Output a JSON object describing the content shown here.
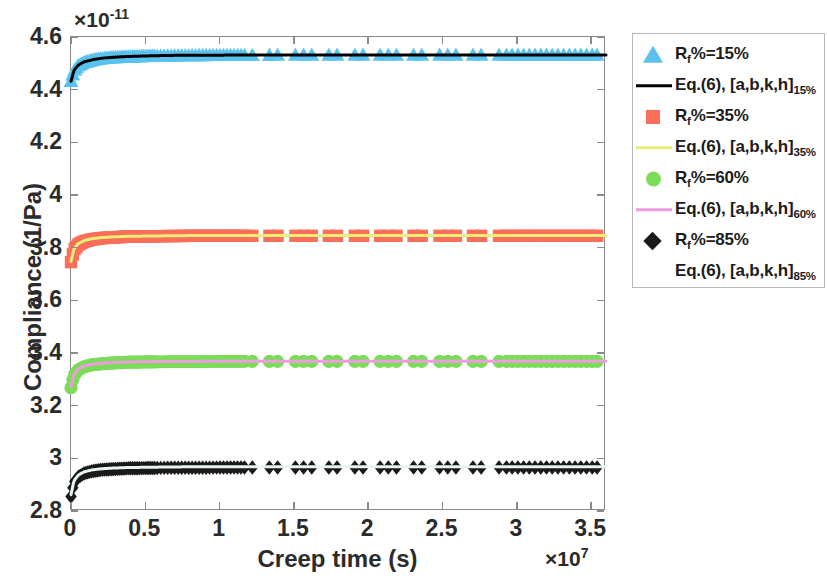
{
  "chart_data": {
    "type": "scatter",
    "title": "",
    "xlabel": "Creep time  (s)",
    "ylabel": "Compliance (1/Pa)",
    "x_exponent_label": "×10",
    "x_exponent_value": "7",
    "y_exponent_label": "×10",
    "y_exponent_value": "-11",
    "xlim": [
      0,
      3.6
    ],
    "ylim": [
      2.8,
      4.6
    ],
    "xticks": [
      "0",
      "0.5",
      "1",
      "1.5",
      "2",
      "2.5",
      "3",
      "3.5"
    ],
    "xtick_values": [
      0,
      0.5,
      1,
      1.5,
      2,
      2.5,
      3,
      3.5
    ],
    "yticks": [
      "2.8",
      "3",
      "3.2",
      "3.4",
      "3.6",
      "3.8",
      "4",
      "4.2",
      "4.4",
      "4.6"
    ],
    "ytick_values": [
      2.8,
      3.0,
      3.2,
      3.4,
      3.6,
      3.8,
      4.0,
      4.2,
      4.4,
      4.6
    ],
    "grid": false,
    "legend_position": "right-outside",
    "series": [
      {
        "name": "R_f%=15%",
        "marker": "triangle",
        "color": "#5BC2F0",
        "plateau": 4.532,
        "start": 4.432,
        "x": [
          0.0,
          0.02,
          0.05,
          0.09,
          0.14,
          0.2,
          0.28,
          0.38,
          0.5,
          0.65,
          0.82,
          1.0,
          1.2,
          1.45,
          1.7,
          2.0,
          2.3,
          2.6,
          2.9,
          3.2,
          3.5
        ],
        "values": [
          4.432,
          4.472,
          4.492,
          4.504,
          4.512,
          4.518,
          4.522,
          4.525,
          4.527,
          4.529,
          4.53,
          4.531,
          4.531,
          4.532,
          4.532,
          4.532,
          4.532,
          4.532,
          4.532,
          4.532,
          4.532
        ]
      },
      {
        "name": "Eq.(6), [a,b,k,h]_15%",
        "marker": "line",
        "color": "#000000",
        "x": [
          0.0,
          0.02,
          0.05,
          0.09,
          0.14,
          0.2,
          0.28,
          0.38,
          0.5,
          0.65,
          0.82,
          1.0,
          1.2,
          1.45,
          1.7,
          2.0,
          2.3,
          2.6,
          2.9,
          3.2,
          3.5
        ],
        "values": [
          4.432,
          4.474,
          4.494,
          4.506,
          4.513,
          4.519,
          4.523,
          4.526,
          4.528,
          4.53,
          4.531,
          4.531,
          4.532,
          4.532,
          4.532,
          4.532,
          4.532,
          4.532,
          4.532,
          4.532,
          4.532
        ]
      },
      {
        "name": "R_f%=35%",
        "marker": "square",
        "color": "#FA6E5A",
        "plateau": 3.845,
        "start": 3.745,
        "x": [
          0.0,
          0.02,
          0.05,
          0.09,
          0.14,
          0.2,
          0.28,
          0.38,
          0.5,
          0.65,
          0.82,
          1.0,
          1.2,
          1.45,
          1.7,
          2.0,
          2.3,
          2.6,
          2.9,
          3.2,
          3.5
        ],
        "values": [
          3.745,
          3.792,
          3.812,
          3.824,
          3.831,
          3.836,
          3.839,
          3.842,
          3.843,
          3.844,
          3.845,
          3.845,
          3.845,
          3.845,
          3.845,
          3.845,
          3.845,
          3.845,
          3.845,
          3.845,
          3.845
        ]
      },
      {
        "name": "Eq.(6), [a,b,k,h]_35%",
        "marker": "line",
        "color": "#E8F07A",
        "x": [
          0.0,
          0.02,
          0.05,
          0.09,
          0.14,
          0.2,
          0.28,
          0.38,
          0.5,
          0.65,
          0.82,
          1.0,
          1.2,
          1.45,
          1.7,
          2.0,
          2.3,
          2.6,
          2.9,
          3.2,
          3.5
        ],
        "values": [
          3.748,
          3.796,
          3.816,
          3.827,
          3.834,
          3.838,
          3.841,
          3.843,
          3.844,
          3.845,
          3.846,
          3.846,
          3.846,
          3.846,
          3.846,
          3.846,
          3.846,
          3.846,
          3.846,
          3.846,
          3.846
        ]
      },
      {
        "name": "R_f%=60%",
        "marker": "circle",
        "color": "#7CDC5A",
        "plateau": 3.368,
        "start": 3.268,
        "x": [
          0.0,
          0.02,
          0.05,
          0.09,
          0.14,
          0.2,
          0.28,
          0.38,
          0.5,
          0.65,
          0.82,
          1.0,
          1.2,
          1.45,
          1.7,
          2.0,
          2.3,
          2.6,
          2.9,
          3.2,
          3.5
        ],
        "values": [
          3.268,
          3.316,
          3.336,
          3.348,
          3.355,
          3.359,
          3.362,
          3.365,
          3.366,
          3.367,
          3.367,
          3.368,
          3.368,
          3.368,
          3.368,
          3.368,
          3.368,
          3.368,
          3.368,
          3.368,
          3.368
        ]
      },
      {
        "name": "Eq.(6), [a,b,k,h]_60%",
        "marker": "line",
        "color": "#EE9CE0",
        "x": [
          0.0,
          0.02,
          0.05,
          0.09,
          0.14,
          0.2,
          0.28,
          0.38,
          0.5,
          0.65,
          0.82,
          1.0,
          1.2,
          1.45,
          1.7,
          2.0,
          2.3,
          2.6,
          2.9,
          3.2,
          3.5
        ],
        "values": [
          3.272,
          3.32,
          3.34,
          3.351,
          3.357,
          3.361,
          3.364,
          3.366,
          3.367,
          3.368,
          3.368,
          3.369,
          3.369,
          3.369,
          3.369,
          3.369,
          3.369,
          3.369,
          3.369,
          3.369,
          3.369
        ]
      },
      {
        "name": "R_f%=85%",
        "marker": "diamond",
        "color": "#1A1A1A",
        "plateau": 2.965,
        "start": 2.855,
        "x": [
          0.0,
          0.02,
          0.05,
          0.09,
          0.14,
          0.2,
          0.28,
          0.38,
          0.5,
          0.65,
          0.82,
          1.0,
          1.2,
          1.45,
          1.7,
          2.0,
          2.3,
          2.6,
          2.9,
          3.2,
          3.5
        ],
        "values": [
          2.855,
          2.908,
          2.93,
          2.943,
          2.951,
          2.956,
          2.959,
          2.962,
          2.963,
          2.964,
          2.964,
          2.965,
          2.965,
          2.965,
          2.965,
          2.965,
          2.965,
          2.965,
          2.965,
          2.965,
          2.965
        ]
      },
      {
        "name": "Eq.(6), [a,b,k,h]_85%",
        "marker": "line",
        "color": "#E8F4F4",
        "x": [
          0.0,
          0.02,
          0.05,
          0.09,
          0.14,
          0.2,
          0.28,
          0.38,
          0.5,
          0.65,
          0.82,
          1.0,
          1.2,
          1.45,
          1.7,
          2.0,
          2.3,
          2.6,
          2.9,
          3.2,
          3.5
        ],
        "values": [
          2.862,
          2.915,
          2.937,
          2.949,
          2.956,
          2.96,
          2.963,
          2.965,
          2.966,
          2.967,
          2.968,
          2.968,
          2.968,
          2.968,
          2.968,
          2.968,
          2.968,
          2.968,
          2.968,
          2.968,
          2.968
        ]
      }
    ]
  },
  "axes": {
    "x_title": "Creep time  (s)",
    "y_title": "Compliance (1/Pa)",
    "x_exp_base": "×10",
    "x_exp_sup": "7",
    "y_exp_base": "×10",
    "y_exp_sup": "-11",
    "xticks": [
      "0",
      "0.5",
      "1",
      "1.5",
      "2",
      "2.5",
      "3",
      "3.5"
    ],
    "yticks": [
      "2.8",
      "3",
      "3.2",
      "3.4",
      "3.6",
      "3.8",
      "4",
      "4.2",
      "4.4",
      "4.6"
    ]
  },
  "legend": {
    "entries": [
      {
        "key": "triangle",
        "color": "#5BC2F0",
        "main": "R",
        "sub1": "f",
        "rest": "%=15%",
        "sub2": ""
      },
      {
        "key": "line",
        "color": "#000000",
        "main": "Eq.(6), [a,b,k,h]",
        "sub1": "",
        "rest": "",
        "sub2": "15%"
      },
      {
        "key": "square",
        "color": "#FA6E5A",
        "main": "R",
        "sub1": "f",
        "rest": "%=35%",
        "sub2": ""
      },
      {
        "key": "line",
        "color": "#E8F07A",
        "main": "Eq.(6), [a,b,k,h]",
        "sub1": "",
        "rest": "",
        "sub2": "35%"
      },
      {
        "key": "circle",
        "color": "#7CDC5A",
        "main": "R",
        "sub1": "f",
        "rest": "%=60%",
        "sub2": ""
      },
      {
        "key": "line",
        "color": "#EE9CE0",
        "main": "Eq.(6), [a,b,k,h]",
        "sub1": "",
        "rest": "",
        "sub2": "60%"
      },
      {
        "key": "diamond",
        "color": "#1A1A1A",
        "main": "R",
        "sub1": "f",
        "rest": "%=85%",
        "sub2": ""
      },
      {
        "key": "line",
        "color": "#FFFFFF",
        "main": "Eq.(6), [a,b,k,h]",
        "sub1": "",
        "rest": "",
        "sub2": "85%"
      }
    ]
  }
}
